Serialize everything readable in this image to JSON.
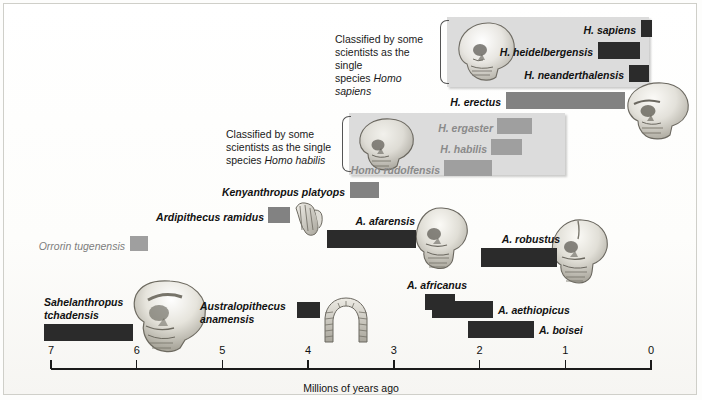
{
  "figure": {
    "axis_title": "Millions of years ago",
    "axis_ticks": [
      "7",
      "6",
      "5",
      "4",
      "3",
      "2",
      "1",
      "0"
    ],
    "axis_min": 0,
    "axis_max": 7
  },
  "notes": {
    "sapiens_note_line1": "Classified by some",
    "sapiens_note_line2": "scientists as the single",
    "sapiens_note_line3_pre": "species ",
    "sapiens_note_line3_em": "Homo sapiens",
    "habilis_note_line1": "Classified by some",
    "habilis_note_line2": "scientists as the single",
    "habilis_note_line3_pre": "species ",
    "habilis_note_line3_em": "Homo habilis"
  },
  "labels": {
    "h_sapiens": "H. sapiens",
    "h_heidelbergensis": "H. heidelbergensis",
    "h_neanderthalensis": "H. neanderthalensis",
    "h_erectus": "H. erectus",
    "h_ergaster": "H. ergaster",
    "h_habilis": "H. habilis",
    "h_rudolfensis": "Homo rudolfensis",
    "kenyanthropus": "Kenyanthropus platyops",
    "ardipithecus": "Ardipithecus ramidus",
    "a_afarensis": "A. afarensis",
    "a_robustus": "A. robustus",
    "orrorin": "Orrorin tugenensis",
    "a_africanus": "A. africanus",
    "a_aethiopicus": "A. aethiopicus",
    "a_boisei": "A. boisei",
    "sahelanthropus_l1": "Sahelanthropus",
    "sahelanthropus_l2": "tchadensis",
    "anamensis_l1": "Australopithecus",
    "anamensis_l2": "anamensis"
  },
  "colors": {
    "bar_dark": "#2b2b2b",
    "bar_mid": "#828282",
    "bar_light": "#9f9f9f",
    "group_box": "#dcdcdc",
    "axis": "#1b1b1b",
    "page": "#ffffff"
  },
  "chart_data": {
    "type": "bar",
    "orientation": "horizontal-range",
    "title": "",
    "xlabel": "Millions of years ago",
    "ylabel": "",
    "xlim": [
      7,
      0
    ],
    "x_reversed": true,
    "grid": false,
    "legend": "none",
    "axis_ticks": [
      7,
      6,
      5,
      4,
      3,
      2,
      1,
      0
    ],
    "series": [
      {
        "name": "H. sapiens",
        "start_mya": 0.12,
        "end_mya": 0.0,
        "color": "#2b2b2b",
        "shade": "dark",
        "row": 0
      },
      {
        "name": "H. heidelbergensis",
        "start_mya": 0.62,
        "end_mya": 0.13,
        "color": "#2b2b2b",
        "shade": "dark",
        "row": 1
      },
      {
        "name": "H. neanderthalensis",
        "start_mya": 0.26,
        "end_mya": 0.03,
        "color": "#2b2b2b",
        "shade": "dark",
        "row": 2
      },
      {
        "name": "H. erectus",
        "start_mya": 1.7,
        "end_mya": 0.31,
        "color": "#828282",
        "shade": "mid",
        "row": 3
      },
      {
        "name": "H. ergaster",
        "start_mya": 1.8,
        "end_mya": 1.39,
        "color": "#9f9f9f",
        "shade": "light",
        "row": 4
      },
      {
        "name": "H. habilis",
        "start_mya": 1.87,
        "end_mya": 1.51,
        "color": "#9f9f9f",
        "shade": "light",
        "row": 5
      },
      {
        "name": "Homo rudolfensis",
        "start_mya": 2.42,
        "end_mya": 1.86,
        "color": "#9f9f9f",
        "shade": "light",
        "row": 6
      },
      {
        "name": "Kenyanthropus platyops",
        "start_mya": 3.52,
        "end_mya": 3.18,
        "color": "#828282",
        "shade": "mid",
        "row": 7
      },
      {
        "name": "Ardipithecus ramidus",
        "start_mya": 4.48,
        "end_mya": 4.22,
        "color": "#828282",
        "shade": "mid",
        "row": 8
      },
      {
        "name": "A. afarensis",
        "start_mya": 3.79,
        "end_mya": 2.75,
        "color": "#2b2b2b",
        "shade": "dark",
        "row": 9
      },
      {
        "name": "A. robustus",
        "start_mya": 1.99,
        "end_mya": 1.1,
        "color": "#2b2b2b",
        "shade": "dark",
        "row": 10
      },
      {
        "name": "Orrorin tugenensis",
        "start_mya": 6.1,
        "end_mya": 5.89,
        "color": "#9f9f9f",
        "shade": "light",
        "row": 11
      },
      {
        "name": "A. africanus",
        "start_mya": 2.64,
        "end_mya": 2.29,
        "color": "#2b2b2b",
        "shade": "dark",
        "row": 12
      },
      {
        "name": "A. aethiopicus",
        "start_mya": 2.56,
        "end_mya": 1.84,
        "color": "#2b2b2b",
        "shade": "dark",
        "row": 13
      },
      {
        "name": "A. boisei",
        "start_mya": 2.14,
        "end_mya": 1.37,
        "color": "#2b2b2b",
        "shade": "dark",
        "row": 14
      },
      {
        "name": "Sahelanthropus tchadensis",
        "start_mya": 7.09,
        "end_mya": 6.05,
        "color": "#2b2b2b",
        "shade": "dark",
        "row": 15
      },
      {
        "name": "Australopithecus anamensis",
        "start_mya": 4.14,
        "end_mya": 3.87,
        "color": "#2b2b2b",
        "shade": "dark",
        "row": 16
      }
    ],
    "groups": [
      {
        "label": "Classified by some scientists as the single species Homo sapiens",
        "members": [
          "H. sapiens",
          "H. heidelbergensis",
          "H. neanderthalensis"
        ]
      },
      {
        "label": "Classified by some scientists as the single species Homo habilis",
        "members": [
          "H. ergaster",
          "H. habilis",
          "Homo rudolfensis"
        ]
      }
    ]
  }
}
